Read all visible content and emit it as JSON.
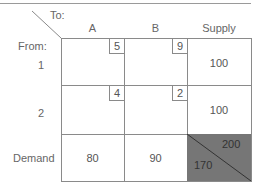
{
  "header": {
    "to_label": "To:",
    "from_label": "From:",
    "columns": [
      "A",
      "B",
      "Supply"
    ]
  },
  "rows": [
    {
      "label": "1",
      "costs": [
        "5",
        "9"
      ],
      "supply": "100"
    },
    {
      "label": "2",
      "costs": [
        "4",
        "2"
      ],
      "supply": "100"
    }
  ],
  "demand": {
    "label": "Demand",
    "values": [
      "80",
      "90"
    ],
    "total_supply": "200",
    "total_demand": "170"
  },
  "colors": {
    "grid": "#8a8a8a",
    "shaded_cell": "#767676",
    "text": "#555555"
  }
}
